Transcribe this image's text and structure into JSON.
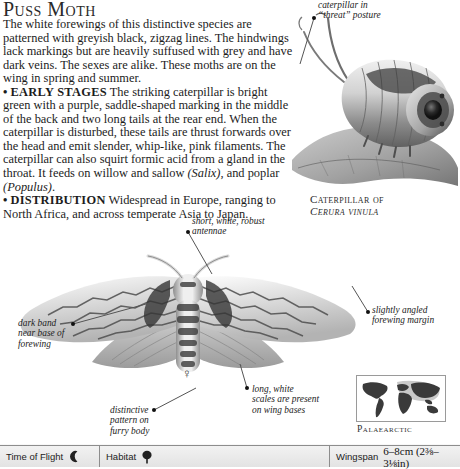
{
  "page": {
    "title": "Puss Moth",
    "body_paragraphs": [
      "The white forewings of this distinctive species are patterned with greyish black, zigzag lines. The hindwings lack markings but are heavily suffused with grey and have dark veins. The sexes are alike. These moths are on the wing in spring and summer.",
      "EARLY STAGES",
      "The striking caterpillar is bright green with a purple, saddle-shaped marking in the middle of the back and two long tails at the rear end. When the caterpillar is disturbed, these tails are thrust forwards over the head and emit slender, whip-like, pink filaments. The caterpillar can also squirt formic acid from a gland in the throat. It feeds on willow and sallow (Salix), and poplar (Populus).",
      "DISTRIBUTION",
      "Widespread in Europe, ranging to North Africa, and across temperate Asia to Japan."
    ]
  },
  "captions": {
    "caterpillar_threat": "caterpillar in\n“threat” posture",
    "caterpillar_of": "Caterpillar of",
    "caterpillar_species": "Cerura vinula",
    "antennae": "short, white, robust\nantennae",
    "dark_band": "dark band\nnear base of\nforewing",
    "forewing_margin": "slightly angled\nforewing margin",
    "wing_scales": "long, white\nscales are present\non wing bases",
    "furry_body": "distinctive\npattern on\nfurry body"
  },
  "map": {
    "region_label": "Palaearctic"
  },
  "footer": {
    "time_of_flight_label": "Time of Flight",
    "time_of_flight_icon": "crescent-moon-icon",
    "habitat_label": "Habitat",
    "habitat_icon": "deciduous-tree-icon",
    "wingspan_label": "Wingspan",
    "wingspan_value": "6–8cm (2⅜–3⅛in)"
  },
  "symbols": {
    "female": "♀"
  },
  "colors": {
    "text": "#1c1c1c",
    "footer_bg": "#e8e8e8",
    "rule": "#8d8d8d",
    "map_land": "#3a3a3a",
    "map_highlight": "#c9c9c9"
  }
}
